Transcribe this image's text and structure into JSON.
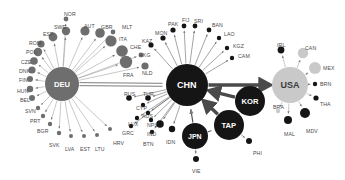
{
  "figure": {
    "type": "network-diagram",
    "title": "",
    "background": "#ffffff",
    "width": 345,
    "height": 180,
    "colors": {
      "hub_grey": "#6e6e6e",
      "hub_black": "#151515",
      "hub_light": "#c9c9c9",
      "node_grey": "#6e6e6e",
      "node_black": "#151515",
      "node_light": "#c9c9c9",
      "edge_grey": "#8d8d8d",
      "edge_black": "#3c3c3c",
      "label": "#4a4a4a"
    }
  },
  "chart_data": {
    "type": "network",
    "hubs": [
      {
        "id": "DEU",
        "label": "DEU",
        "x": 62,
        "y": 84,
        "r": 17,
        "color": "#6e6e6e",
        "textcolor": "#ffffff"
      },
      {
        "id": "CHN",
        "label": "CHN",
        "x": 187,
        "y": 85,
        "r": 21,
        "color": "#151515",
        "textcolor": "#ffffff"
      },
      {
        "id": "USA",
        "label": "USA",
        "x": 290,
        "y": 85,
        "r": 18,
        "color": "#c9c9c9",
        "textcolor": "#3a3a3a"
      },
      {
        "id": "KOR",
        "label": "KOR",
        "x": 250,
        "y": 101,
        "r": 15,
        "color": "#151515",
        "textcolor": "#ffffff"
      },
      {
        "id": "TAP",
        "label": "TAP",
        "x": 229,
        "y": 125,
        "r": 15,
        "color": "#151515",
        "textcolor": "#ffffff"
      },
      {
        "id": "JPN",
        "label": "JPN",
        "x": 195,
        "y": 136,
        "r": 13,
        "color": "#151515",
        "textcolor": "#ffffff"
      }
    ],
    "nodes": [
      {
        "id": "NOR",
        "label": "NOR",
        "x": 66,
        "y": 19,
        "r": 2.4,
        "color": "#6e6e6e",
        "lx": 64,
        "ly": 11,
        "rot": 0,
        "hub": "DEU"
      },
      {
        "id": "SWE",
        "label": "SWE",
        "x": 66,
        "y": 31,
        "r": 4.2,
        "color": "#6e6e6e",
        "lx": 54,
        "ly": 24,
        "rot": 0,
        "hub": "DEU"
      },
      {
        "id": "ESP",
        "label": "ESP",
        "x": 53,
        "y": 37,
        "r": 4.4,
        "color": "#6e6e6e",
        "lx": 43,
        "ly": 31,
        "rot": 0,
        "hub": "DEU"
      },
      {
        "id": "AUT",
        "label": "AUT",
        "x": 85,
        "y": 31,
        "r": 4.6,
        "color": "#6e6e6e",
        "lx": 84,
        "ly": 23,
        "rot": 0,
        "hub": "DEU"
      },
      {
        "id": "GBR",
        "label": "GBR",
        "x": 100,
        "y": 33,
        "r": 4.8,
        "color": "#6e6e6e",
        "lx": 101,
        "ly": 24,
        "rot": 0,
        "hub": "DEU"
      },
      {
        "id": "MLT",
        "label": "MLT",
        "x": 113,
        "y": 32,
        "r": 2.4,
        "color": "#6e6e6e",
        "lx": 122,
        "ly": 24,
        "rot": 0,
        "hub": "DEU"
      },
      {
        "id": "ITA",
        "label": "ITA",
        "x": 111,
        "y": 41,
        "r": 5.6,
        "color": "#6e6e6e",
        "lx": 119,
        "ly": 36,
        "rot": 0,
        "hub": "DEU"
      },
      {
        "id": "CHE",
        "label": "CHE",
        "x": 122,
        "y": 51,
        "r": 5.8,
        "color": "#6e6e6e",
        "lx": 130,
        "ly": 44,
        "rot": 0,
        "hub": "DEU"
      },
      {
        "id": "HKG",
        "label": "HKG",
        "x": 141,
        "y": 55,
        "r": 2.4,
        "color": "#6e6e6e",
        "lx": 139,
        "ly": 52,
        "rot": 0,
        "hub": "DEU"
      },
      {
        "id": "FRA",
        "label": "FRA",
        "x": 126,
        "y": 62,
        "r": 6.2,
        "color": "#6e6e6e",
        "lx": 123,
        "ly": 72,
        "rot": 0,
        "hub": "DEU"
      },
      {
        "id": "NLD",
        "label": "NLD",
        "x": 145,
        "y": 66,
        "r": 3.6,
        "color": "#6e6e6e",
        "lx": 142,
        "ly": 70,
        "rot": 0,
        "hub": "DEU"
      },
      {
        "id": "ROM",
        "label": "ROM",
        "x": 41,
        "y": 44,
        "r": 3.6,
        "color": "#6e6e6e",
        "lx": 29,
        "ly": 40,
        "rot": 0,
        "hub": "DEU"
      },
      {
        "id": "POL",
        "label": "POL",
        "x": 38,
        "y": 52,
        "r": 4.2,
        "color": "#6e6e6e",
        "lx": 26,
        "ly": 49,
        "rot": 0,
        "hub": "DEU"
      },
      {
        "id": "CZE",
        "label": "CZE",
        "x": 34,
        "y": 61,
        "r": 3.8,
        "color": "#6e6e6e",
        "lx": 21,
        "ly": 59,
        "rot": 0,
        "hub": "DEU"
      },
      {
        "id": "DNK",
        "label": "DNK",
        "x": 32,
        "y": 70,
        "r": 3.6,
        "color": "#6e6e6e",
        "lx": 19,
        "ly": 68,
        "rot": 0,
        "hub": "DEU"
      },
      {
        "id": "FIN",
        "label": "FIN",
        "x": 30,
        "y": 79,
        "r": 3.0,
        "color": "#6e6e6e",
        "lx": 19,
        "ly": 77,
        "rot": 0,
        "hub": "DEU"
      },
      {
        "id": "HUN",
        "label": "HUN",
        "x": 30,
        "y": 89,
        "r": 3.2,
        "color": "#6e6e6e",
        "lx": 17,
        "ly": 88,
        "rot": 0,
        "hub": "DEU"
      },
      {
        "id": "BEL",
        "label": "BEL",
        "x": 32,
        "y": 98,
        "r": 3.0,
        "color": "#6e6e6e",
        "lx": 20,
        "ly": 97,
        "rot": 0,
        "hub": "DEU"
      },
      {
        "id": "SVN",
        "label": "SVN",
        "x": 38,
        "y": 108,
        "r": 2.2,
        "color": "#6e6e6e",
        "lx": 25,
        "ly": 108,
        "rot": 0,
        "hub": "DEU"
      },
      {
        "id": "PRT",
        "label": "PRT",
        "x": 43,
        "y": 116,
        "r": 2.2,
        "color": "#6e6e6e",
        "lx": 30,
        "ly": 118,
        "rot": 0,
        "hub": "DEU"
      },
      {
        "id": "BGR",
        "label": "BGR",
        "x": 50,
        "y": 124,
        "r": 2.2,
        "color": "#6e6e6e",
        "lx": 37,
        "ly": 128,
        "rot": 0,
        "hub": "DEU"
      },
      {
        "id": "SVK",
        "label": "SVK",
        "x": 59,
        "y": 133,
        "r": 2.2,
        "color": "#6e6e6e",
        "lx": 49,
        "ly": 142,
        "rot": 0,
        "hub": "DEU"
      },
      {
        "id": "LVA",
        "label": "LVA",
        "x": 71,
        "y": 136,
        "r": 2.0,
        "color": "#6e6e6e",
        "lx": 65,
        "ly": 146,
        "rot": 0,
        "hub": "DEU"
      },
      {
        "id": "EST",
        "label": "EST",
        "x": 84,
        "y": 136,
        "r": 2.0,
        "color": "#6e6e6e",
        "lx": 80,
        "ly": 146,
        "rot": 0,
        "hub": "DEU"
      },
      {
        "id": "LTU",
        "label": "LTU",
        "x": 97,
        "y": 135,
        "r": 2.0,
        "color": "#6e6e6e",
        "lx": 95,
        "ly": 146,
        "rot": 0,
        "hub": "DEU"
      },
      {
        "id": "HRV",
        "label": "HRV",
        "x": 110,
        "y": 129,
        "r": 2.0,
        "color": "#6e6e6e",
        "lx": 113,
        "ly": 140,
        "rot": 0,
        "hub": "DEU"
      },
      {
        "id": "KAZ",
        "label": "KAZ",
        "x": 151,
        "y": 45,
        "r": 2.6,
        "color": "#151515",
        "lx": 142,
        "ly": 38,
        "rot": 0,
        "hub": "CHN"
      },
      {
        "id": "MON",
        "label": "MON",
        "x": 163,
        "y": 38,
        "r": 2.6,
        "color": "#151515",
        "lx": 155,
        "ly": 30,
        "rot": 0,
        "hub": "CHN"
      },
      {
        "id": "PAK",
        "label": "PAK",
        "x": 173,
        "y": 30,
        "r": 2.6,
        "color": "#151515",
        "lx": 168,
        "ly": 21,
        "rot": 0,
        "hub": "CHN"
      },
      {
        "id": "FIJ",
        "label": "FIJ",
        "x": 184,
        "y": 26,
        "r": 2.4,
        "color": "#151515",
        "lx": 182,
        "ly": 17,
        "rot": 0,
        "hub": "CHN"
      },
      {
        "id": "SRI",
        "label": "SRI",
        "x": 195,
        "y": 26,
        "r": 2.4,
        "color": "#151515",
        "lx": 194,
        "ly": 18,
        "rot": 0,
        "hub": "CHN"
      },
      {
        "id": "BAN",
        "label": "BAN",
        "x": 209,
        "y": 30,
        "r": 2.4,
        "color": "#151515",
        "lx": 212,
        "ly": 22,
        "rot": 0,
        "hub": "CHN"
      },
      {
        "id": "LAO",
        "label": "LAO",
        "x": 219,
        "y": 38,
        "r": 2.2,
        "color": "#151515",
        "lx": 224,
        "ly": 31,
        "rot": 0,
        "hub": "CHN"
      },
      {
        "id": "KGZ",
        "label": "KGZ",
        "x": 227,
        "y": 48,
        "r": 2.2,
        "color": "#151515",
        "lx": 233,
        "ly": 43,
        "rot": 0,
        "hub": "CHN"
      },
      {
        "id": "CAM",
        "label": "CAM",
        "x": 232,
        "y": 58,
        "r": 2.2,
        "color": "#151515",
        "lx": 238,
        "ly": 53,
        "rot": 0,
        "hub": "CHN"
      },
      {
        "id": "RUS",
        "label": "RUS",
        "x": 129,
        "y": 98,
        "r": 2.8,
        "color": "#151515",
        "lx": 124,
        "ly": 91,
        "rot": 0,
        "hub": "CHN"
      },
      {
        "id": "TUR",
        "label": "TUR",
        "x": 148,
        "y": 98,
        "r": 2.8,
        "color": "#151515",
        "lx": 143,
        "ly": 91,
        "rot": 0,
        "hub": "CHN"
      },
      {
        "id": "CYP",
        "label": "CYP",
        "x": 143,
        "y": 105,
        "r": 2.2,
        "color": "#151515",
        "lx": 136,
        "ly": 105,
        "rot": 0,
        "hub": "CHN"
      },
      {
        "id": "AUS",
        "label": "AUS",
        "x": 148,
        "y": 113,
        "r": 2.2,
        "color": "#151515",
        "lx": 142,
        "ly": 113,
        "rot": 0,
        "hub": "CHN"
      },
      {
        "id": "LUX",
        "label": "LUX",
        "x": 137,
        "y": 118,
        "r": 2.2,
        "color": "#151515",
        "lx": 128,
        "ly": 121,
        "rot": 0,
        "hub": "CHN"
      },
      {
        "id": "NPL",
        "label": "NPL",
        "x": 151,
        "y": 120,
        "r": 2.2,
        "color": "#151515",
        "lx": 147,
        "ly": 122,
        "rot": 0,
        "hub": "CHN"
      },
      {
        "id": "GRC",
        "label": "GRC",
        "x": 131,
        "y": 126,
        "r": 2.2,
        "color": "#151515",
        "lx": 122,
        "ly": 130,
        "rot": 0,
        "hub": "CHN"
      },
      {
        "id": "IND",
        "label": "IND",
        "x": 160,
        "y": 124,
        "r": 3.8,
        "color": "#151515",
        "lx": 147,
        "ly": 131,
        "rot": 0,
        "hub": "CHN"
      },
      {
        "id": "BTN",
        "label": "BTN",
        "x": 152,
        "y": 132,
        "r": 2.2,
        "color": "#151515",
        "lx": 143,
        "ly": 141,
        "rot": 0,
        "hub": "CHN"
      },
      {
        "id": "IDN",
        "label": "IDN",
        "x": 172,
        "y": 129,
        "r": 3.2,
        "color": "#151515",
        "lx": 166,
        "ly": 139,
        "rot": 0,
        "hub": "CHN"
      },
      {
        "id": "VIE",
        "label": "VIE",
        "x": 196,
        "y": 159,
        "r": 3.0,
        "color": "#151515",
        "lx": 192,
        "ly": 168,
        "rot": 0,
        "hub": "JPN"
      },
      {
        "id": "PHI",
        "label": "PHI",
        "x": 249,
        "y": 141,
        "r": 3.0,
        "color": "#151515",
        "lx": 253,
        "ly": 150,
        "rot": 0,
        "hub": "TAP"
      },
      {
        "id": "IRL",
        "label": "IRL",
        "x": 281,
        "y": 50,
        "r": 3.4,
        "color": "#151515",
        "lx": 277,
        "ly": 42,
        "rot": 0,
        "hub": "USA"
      },
      {
        "id": "CAN",
        "label": "CAN",
        "x": 303,
        "y": 53,
        "r": 5.2,
        "color": "#c9c9c9",
        "lx": 305,
        "ly": 45,
        "rot": 0,
        "hub": "USA"
      },
      {
        "id": "MEX",
        "label": "MEX",
        "x": 315,
        "y": 68,
        "r": 6.0,
        "color": "#c9c9c9",
        "lx": 323,
        "ly": 65,
        "rot": 0,
        "hub": "USA"
      },
      {
        "id": "BRN",
        "label": "BRN",
        "x": 315,
        "y": 84,
        "r": 2.2,
        "color": "#151515",
        "lx": 320,
        "ly": 81,
        "rot": 0,
        "hub": "USA"
      },
      {
        "id": "THA",
        "label": "THA",
        "x": 316,
        "y": 98,
        "r": 2.6,
        "color": "#151515",
        "lx": 320,
        "ly": 101,
        "rot": 0,
        "hub": "USA"
      },
      {
        "id": "BRA",
        "label": "BRA",
        "x": 278,
        "y": 111,
        "r": 2.2,
        "color": "#c9c9c9",
        "lx": 273,
        "ly": 104,
        "rot": 0,
        "hub": "USA"
      },
      {
        "id": "MAL",
        "label": "MAL",
        "x": 288,
        "y": 120,
        "r": 4.0,
        "color": "#151515",
        "lx": 284,
        "ly": 131,
        "rot": 0,
        "hub": "USA"
      },
      {
        "id": "MDV",
        "label": "MDV",
        "x": 305,
        "y": 113,
        "r": 5.0,
        "color": "#151515",
        "lx": 306,
        "ly": 128,
        "rot": 0,
        "hub": "USA"
      }
    ],
    "major_edges": [
      {
        "from": "DEU",
        "to": "CHN",
        "style": "double-line",
        "color": "#6e6e6e"
      },
      {
        "from": "CHN",
        "to": "USA",
        "style": "thick-arrow",
        "color": "#4a4a4a"
      },
      {
        "from": "KOR",
        "to": "CHN",
        "style": "thick-arrow",
        "color": "#4a4a4a"
      },
      {
        "from": "TAP",
        "to": "CHN",
        "style": "thick-arrow",
        "color": "#4a4a4a"
      },
      {
        "from": "JPN",
        "to": "CHN",
        "style": "arrow",
        "color": "#4a4a4a"
      },
      {
        "from": "TAP",
        "to": "KOR",
        "style": "line",
        "color": "#4a4a4a"
      },
      {
        "from": "JPN",
        "to": "TAP",
        "style": "line",
        "color": "#4a4a4a"
      }
    ]
  }
}
